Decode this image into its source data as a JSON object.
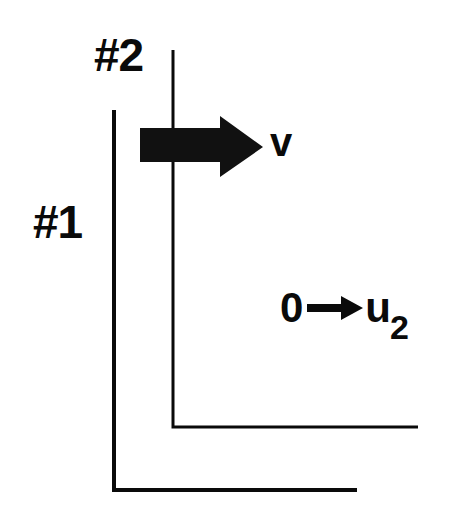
{
  "figure": {
    "type": "physics-wave-diagram",
    "background_color": "#ffffff",
    "ink_color": "#0a0a0a"
  },
  "labels": {
    "wall_2": "#2",
    "wall_1": "#1",
    "velocity": "v",
    "state_before": "0",
    "state_arrow": "→",
    "state_after_base": "u",
    "state_after_subscript": "2"
  },
  "geometry": {
    "wall_1": {
      "vertical_x": 114,
      "vertical_top_y": 110,
      "corner_y": 490,
      "horizontal_end_x": 357,
      "stroke_width": 4
    },
    "wall_2": {
      "vertical_x": 173,
      "vertical_top_y": 50,
      "corner_y": 427,
      "horizontal_end_x": 418,
      "stroke_width": 3
    },
    "block_arrow": {
      "shaft_left_x": 140,
      "shaft_top_y": 128,
      "shaft_bottom_y": 162,
      "head_start_x": 220,
      "head_top_y": 116,
      "head_bottom_y": 177,
      "tip_x": 263,
      "fill": "#111111"
    }
  }
}
